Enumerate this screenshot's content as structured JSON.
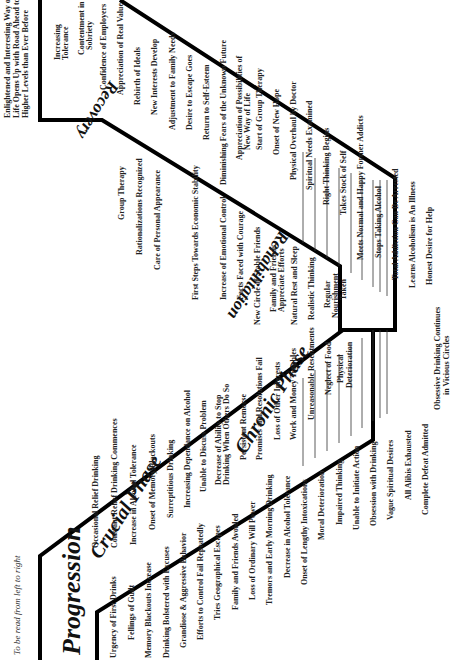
{
  "diagram": {
    "title": "Progression",
    "reading_note": "To be read from left to right",
    "phases": {
      "crucial": "Crucial Phase",
      "chronic": "Chronic Phase",
      "rehabilitation": "Rehabilitation",
      "recovery": "Recovery"
    },
    "progression_upper": [
      "Occasional Relief Drinking",
      "Constant Relief Drinking Commences",
      "Increase in Alcohol Tolerance",
      "Onset of Memory Blackouts",
      "Surreptitious Drinking",
      "Increasing Dependance on Alcohol",
      "Unable to Discuss Problem",
      "Decrease of Ability to Stop",
      "Drinking When Others Do So",
      "Persistent Remorse",
      "Promises and Resolutions Fail",
      "Loss of Other Interests",
      "Work and Money Troubles",
      "Unreasonable Resentments",
      "Neglect of Food",
      "Physical",
      "Deterioration"
    ],
    "progression_lower": [
      "Urgency of First Drinks",
      "Fellings of Guilt",
      "Memory Blackouts Increase",
      "Drinking Bolstered with Excuses",
      "Grandiose & Aggressive Behavior",
      "Efforts to Control Fail Repeatedly",
      "Tries Geographical Escapes",
      "Family and Friends Avoided",
      "Loss of Ordinary Will Power",
      "Tremors and Early Morning Drinking",
      "Decrease in Alcohol Tolerance",
      "Onset of Lengthy Intoxications",
      "Moral Deterioration",
      "Impaired Thinking",
      "Unable to Initiate Action",
      "Obsession with Drinking",
      "Vague Spiritual Desires",
      "All Alibis Exhausted",
      "Complete Defeat Admitted"
    ],
    "bottom_note_1": "Obsessive Drinking Continues",
    "bottom_note_2": "in Vicious Circles",
    "recovery_lower": [
      "Honest Desire for Help",
      "Learns Alcoholism is An Illness",
      "Total Addiction Can Be Arrested",
      "Stops Taking Alcohol",
      "Meets Normal and Happy Former Addicts",
      "Takes Stock of Self",
      "Right Thinking Begins",
      "Spiritual Needs Examined",
      "Physical Overhaul by Doctor",
      "Onset of New Hope",
      "Start of Group Therapy",
      "Appreciation of Possibilities of",
      "New Way of Life",
      "Diminishing Fears of the Unknown Future",
      "Return to Self-Esteem",
      "Desire to Escape Goes",
      "Adjustment to Family Needs",
      "New Interests Develop",
      "Rebirth of Ideals",
      "Appreciation of Real Value",
      "Confidence of Employers",
      "Contentment in",
      "Sobriety",
      "Increasing",
      "Tolerance"
    ],
    "recovery_upper": [
      "Regular",
      "Nourishment",
      "Taken",
      "Realistic Thinking",
      "Natural Rest and Sleep",
      "Family and Friends",
      "Appreciate Efforts",
      "New Circle of Stable Friends",
      "Facts Faced with Courage",
      "Increase of Emotional Control",
      "First Steps Towards Economic Stability",
      "Care of Personal Appearance",
      "Rationalizations Recognized",
      "Group Therapy"
    ],
    "final_1": "Enlightened and Interesting Way of",
    "final_2": "Life Opens Up with Road Ahead to",
    "final_3": "Higher Levels than Ever Before"
  }
}
